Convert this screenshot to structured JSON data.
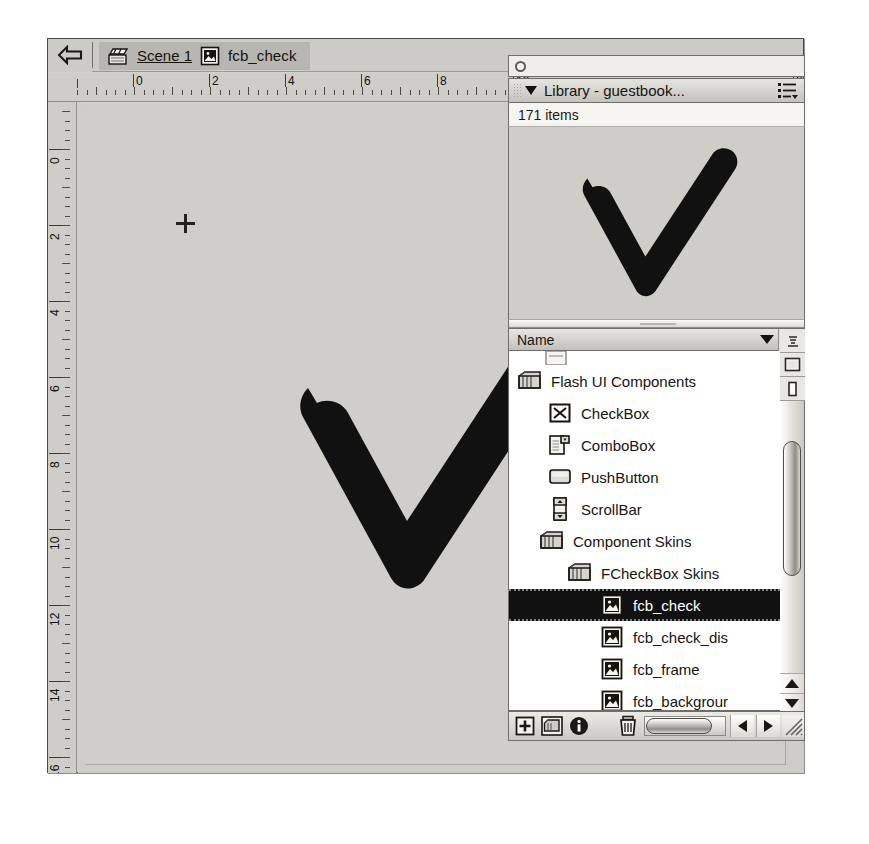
{
  "app": {
    "edit_bar": {
      "back_icon": "back-arrow-icon",
      "scene_icon": "clapperboard-icon",
      "scene_label": "Scene 1",
      "symbol_icon": "movie-clip-symbol-icon",
      "symbol_label": "fcb_check"
    },
    "rulers": {
      "horizontal_labels": [
        "0",
        "2",
        "4",
        "6",
        "8",
        "10",
        "20"
      ],
      "vertical_labels": [
        "0",
        "2",
        "4",
        "6",
        "8",
        "10",
        "12",
        "14",
        "16"
      ],
      "unit_note": ""
    },
    "stage": {
      "registration_icon": "registration-crosshair-icon",
      "artwork_name": "checkmark-shape",
      "artwork_color": "#111111",
      "background_color": "#d0cecb"
    }
  },
  "library": {
    "window_close_icon": "close-circle-icon",
    "panel_title": "Library - guestbook...",
    "options_icon": "panel-options-icon",
    "disclosure_icon": "disclosure-triangle-icon",
    "items_count": "171 items",
    "preview_artwork": "checkmark-shape",
    "column_header": "Name",
    "sort_icon": "sort-triangle-icon",
    "tree": [
      {
        "label": "",
        "icon": "clipped-item-icon",
        "depth": 1,
        "selected": false,
        "clipped": true
      },
      {
        "label": "Flash UI Components",
        "icon": "folder-icon",
        "depth": 0,
        "selected": false
      },
      {
        "label": "CheckBox",
        "icon": "checkbox-component-icon",
        "depth": 1,
        "selected": false
      },
      {
        "label": "ComboBox",
        "icon": "combobox-component-icon",
        "depth": 1,
        "selected": false
      },
      {
        "label": "PushButton",
        "icon": "pushbutton-component-icon",
        "depth": 1,
        "selected": false
      },
      {
        "label": "ScrollBar",
        "icon": "scrollbar-component-icon",
        "depth": 1,
        "selected": false
      },
      {
        "label": "Component Skins",
        "icon": "folder-icon",
        "depth": 1,
        "selected": false
      },
      {
        "label": "FCheckBox Skins",
        "icon": "folder-icon",
        "depth": 2,
        "selected": false
      },
      {
        "label": "fcb_check",
        "icon": "movie-clip-symbol-icon",
        "depth": 3,
        "selected": true
      },
      {
        "label": "fcb_check_dis",
        "icon": "movie-clip-symbol-icon",
        "depth": 3,
        "selected": false
      },
      {
        "label": "fcb_frame",
        "icon": "movie-clip-symbol-icon",
        "depth": 3,
        "selected": false
      },
      {
        "label": "fcb_backgrour",
        "icon": "movie-clip-symbol-icon",
        "depth": 3,
        "selected": false
      }
    ],
    "bottom_toolbar": {
      "new_symbol_icon": "new-symbol-icon",
      "new_folder_icon": "new-folder-icon",
      "properties_icon": "properties-info-icon",
      "delete_icon": "trash-delete-icon",
      "scroll_left_icon": "scroll-left-arrow-icon",
      "scroll_right_icon": "scroll-right-arrow-icon",
      "resize_icon": "resize-grip-icon"
    },
    "scrollbar": {
      "up_arrow_icon": "scroll-up-arrow-icon",
      "down_arrow_icon": "scroll-down-arrow-icon",
      "wide_view_icon": "wide-state-icon",
      "narrow_view_icon": "narrow-state-icon",
      "resize_toggle_icon": "panel-resize-icon"
    }
  },
  "colors": {
    "chrome": "#cdcbc6",
    "stage": "#d0cecb",
    "artwork": "#111111",
    "selection": "#111111",
    "panel_bg": "#f6f5f2"
  }
}
